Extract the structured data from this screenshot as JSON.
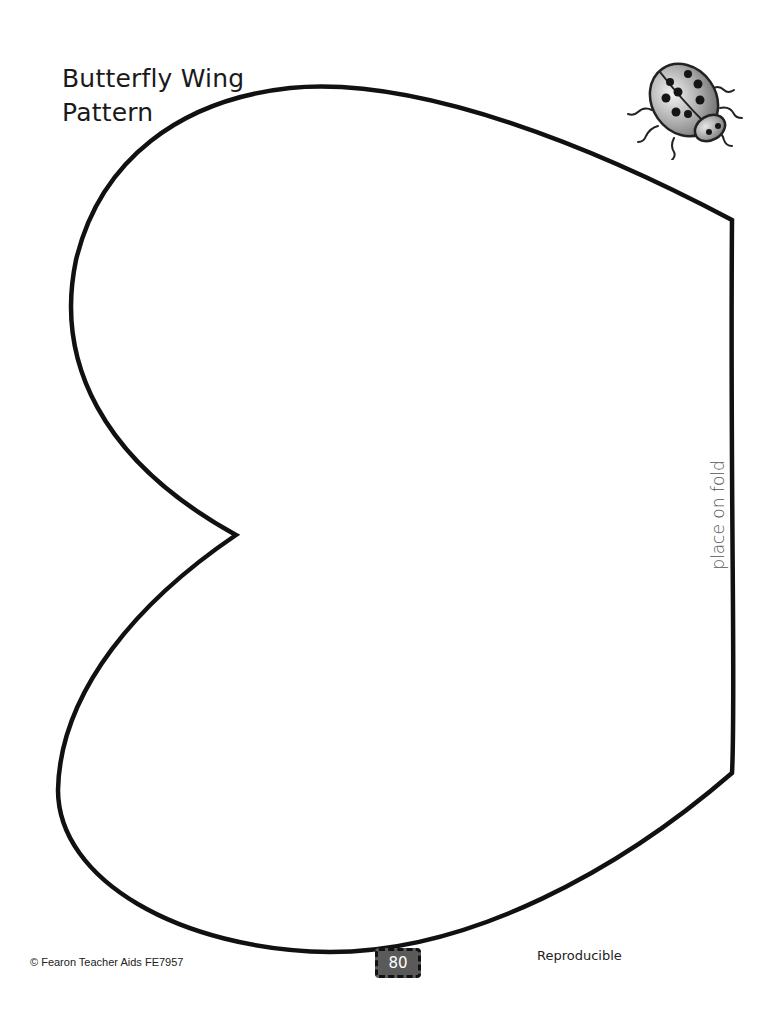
{
  "page": {
    "title_line1": "Butterfly Wing",
    "title_line2": "Pattern",
    "fold_label": "place on fold",
    "footer": {
      "copyright": "© Fearon Teacher Aids  FE7957",
      "page_number": "80",
      "reproducible": "Reproducible"
    },
    "illustration": "ladybug-icon",
    "colors": {
      "outline": "#111111",
      "badge": "#5a5a5a",
      "background": "#ffffff"
    }
  }
}
